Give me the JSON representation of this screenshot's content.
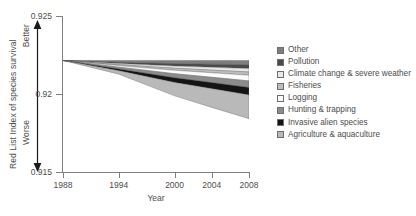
{
  "chart_data": {
    "type": "area",
    "title": "",
    "subtitle": "",
    "xlabel": "Year",
    "ylabel": "Red List Index of species survival",
    "xlim": [
      1988,
      2008
    ],
    "ylim": [
      0.915,
      0.925
    ],
    "xticks": [
      1988,
      1994,
      2000,
      2004,
      2008
    ],
    "xtick_labels": [
      "1988",
      "1994",
      "2000",
      "2004",
      "2008"
    ],
    "yticks": [
      0.915,
      0.92,
      0.925
    ],
    "ytick_labels": [
      "0.915",
      "0.92",
      "0.925"
    ],
    "grid": false,
    "legend_position": "right",
    "stacked": true,
    "baseline_top": 0.92215,
    "direction_labels": {
      "top": "Better",
      "bottom": "Worse"
    },
    "x": [
      1988,
      1994,
      2000,
      2004,
      2008
    ],
    "series": [
      {
        "name": "Other",
        "color": "#7d7d7d",
        "values": [
          0.0,
          0.00012,
          0.0002,
          0.00024,
          0.00028
        ]
      },
      {
        "name": "Pollution",
        "color": "#4a4a4a",
        "values": [
          0.0,
          8e-05,
          0.00016,
          0.0002,
          0.00024
        ]
      },
      {
        "name": "Climate change & severe weather",
        "color": "#e8e8e8",
        "values": [
          0.0,
          7e-05,
          0.00014,
          0.00018,
          0.00022
        ]
      },
      {
        "name": "Fisheries",
        "color": "#bdbdbd",
        "values": [
          0.0,
          6e-05,
          0.00013,
          0.00017,
          0.00021
        ]
      },
      {
        "name": "Logging",
        "color": "#fbfbfb",
        "values": [
          0.0,
          0.0001,
          0.00022,
          0.00029,
          0.00036
        ]
      },
      {
        "name": "Hunting & trapping",
        "color": "#8c8c8c",
        "values": [
          0.0,
          0.00011,
          0.00026,
          0.00034,
          0.00042
        ]
      },
      {
        "name": "Invasive alien species",
        "color": "#141414",
        "values": [
          0.0,
          0.00012,
          0.0003,
          0.00039,
          0.00048
        ]
      },
      {
        "name": "Agriculture & aquaculture",
        "color": "#b9b9b9",
        "values": [
          0.0,
          0.00022,
          0.00086,
          0.0012,
          0.00152
        ]
      }
    ]
  },
  "legend": {
    "items": [
      {
        "label": "Other"
      },
      {
        "label": "Pollution"
      },
      {
        "label": "Climate change & severe weather"
      },
      {
        "label": "Fisheries"
      },
      {
        "label": "Logging"
      },
      {
        "label": "Hunting & trapping"
      },
      {
        "label": "Invasive alien species"
      },
      {
        "label": "Agriculture & aquaculture"
      }
    ]
  }
}
